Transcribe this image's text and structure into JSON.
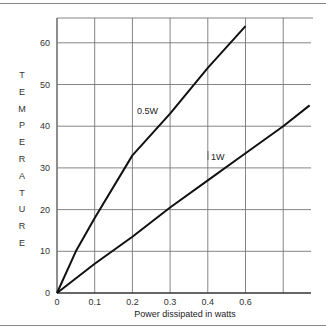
{
  "chart_data": {
    "type": "line",
    "title": "",
    "xlabel": "Power dissipated in watts",
    "ylabel": "TEMPERATURE",
    "ylabel_letters": [
      "T",
      "E",
      "M",
      "P",
      "E",
      "R",
      "A",
      "T",
      "U",
      "R",
      "E"
    ],
    "x_ticks": [
      {
        "pos": 0,
        "label": "0"
      },
      {
        "pos": 1,
        "label": "0.1"
      },
      {
        "pos": 2,
        "label": "0.2"
      },
      {
        "pos": 3,
        "label": "0.3"
      },
      {
        "pos": 4,
        "label": "0.4"
      },
      {
        "pos": 5,
        "label": "0.6"
      },
      {
        "pos": 6,
        "label": ""
      }
    ],
    "y_ticks": [
      "0",
      "10",
      "20",
      "30",
      "40",
      "50",
      "60"
    ],
    "ylim": [
      0,
      65
    ],
    "grid": true,
    "series": [
      {
        "name": "0.5W",
        "label": "0.5W",
        "x_labels": [
          "0",
          "0.1",
          "0.2",
          "0.3",
          "0.4",
          "0.6"
        ],
        "x_pos": [
          0,
          0.5,
          1,
          2,
          3,
          4,
          5
        ],
        "values": [
          0,
          10,
          18,
          33,
          43,
          54,
          64
        ]
      },
      {
        "name": "1W",
        "label": "1W",
        "x_pos": [
          0,
          1,
          2,
          3,
          4,
          5,
          6,
          6.7
        ],
        "values": [
          0,
          7,
          13.5,
          20.5,
          27,
          33.5,
          40,
          45
        ]
      }
    ],
    "legend": "inline labels"
  }
}
